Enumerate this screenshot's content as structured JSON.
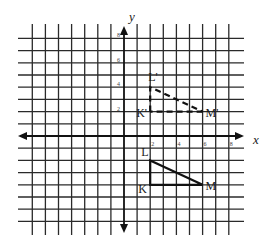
{
  "figure": {
    "type": "coordinate-plane-transformation",
    "axes": {
      "x_label": "x",
      "y_label": "y",
      "x_range": [
        -8,
        9
      ],
      "y_range": [
        -8,
        9
      ],
      "x_tick_labels": [
        {
          "value": 2,
          "text": "2"
        },
        {
          "value": 4,
          "text": "4"
        },
        {
          "value": 6,
          "text": "6"
        },
        {
          "value": 8,
          "text": "8"
        }
      ],
      "y_tick_labels": [
        {
          "value": 2,
          "text": "2"
        },
        {
          "value": 4,
          "text": "4"
        },
        {
          "value": 6,
          "text": "6"
        },
        {
          "value": 8,
          "text": "8"
        }
      ]
    },
    "grid": {
      "x_lines": [
        -7,
        -6,
        -5,
        -4,
        -3,
        -2,
        -1,
        1,
        2,
        3,
        4,
        5,
        6,
        7,
        8
      ],
      "y_lines": [
        8,
        7,
        6,
        5,
        4,
        3,
        2,
        1,
        -1,
        -2,
        -3,
        -4,
        -5,
        -6,
        -7
      ]
    },
    "original_triangle": {
      "style": "solid",
      "vertices": [
        {
          "name": "K",
          "label": "K",
          "x": 2,
          "y": -4
        },
        {
          "name": "L",
          "label": "L",
          "x": 2,
          "y": -2
        },
        {
          "name": "M",
          "label": "M",
          "x": 6,
          "y": -4
        }
      ]
    },
    "image_triangle": {
      "style": "dashed",
      "vertices": [
        {
          "name": "K'",
          "label": "K'",
          "x": 2,
          "y": 2
        },
        {
          "name": "L'",
          "label": "L'",
          "x": 2,
          "y": 4
        },
        {
          "name": "M'",
          "label": "M'",
          "x": 6,
          "y": 2
        }
      ]
    }
  }
}
